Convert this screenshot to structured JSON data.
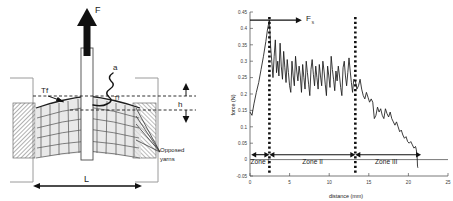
{
  "figure": {
    "panels": [
      "tear-test-schematic",
      "force-distance-plot"
    ]
  },
  "left_diagram": {
    "title_none": "",
    "labels": {
      "force_arrow": "F",
      "yarn_tension_left": "Tf",
      "yarn_tension_right": "Tf",
      "crack_label": "a",
      "height_label": "h",
      "length_label": "L",
      "opposed_yarns_line1": "Opposed",
      "opposed_yarns_line2": "yarns"
    },
    "colors": {
      "ink": "#1a1a1a",
      "grid_fabric": "#555555",
      "clamp_hatch": "#888888",
      "shade_fill": "#d8d8d8",
      "frame": "#9a9a9a"
    }
  },
  "chart_data": {
    "type": "line",
    "title": "",
    "xlabel": "distance (mm)",
    "ylabel": "force (N)",
    "xlim": [
      0,
      25
    ],
    "ylim": [
      -0.05,
      0.45
    ],
    "xticks": [
      0,
      5,
      10,
      15,
      20,
      25
    ],
    "xticklabels": [
      "0",
      "5",
      "10",
      "15",
      "20",
      "25"
    ],
    "yticks": [
      -0.05,
      0,
      0.05,
      0.1,
      0.15,
      0.2,
      0.25,
      0.3,
      0.35,
      0.4,
      0.45
    ],
    "yticklabels": [
      "-0.05",
      "0",
      "0.05",
      "0.1",
      "0.15",
      "0.2",
      "0.25",
      "0.3",
      "0.35",
      "0.4",
      "0.45"
    ],
    "grid": false,
    "legend": null,
    "annotations": [
      {
        "name": "peak-force-arrow",
        "label": "Fs",
        "y": 0.425,
        "x_from": 0.0,
        "x_to": 6.3
      },
      {
        "name": "zone-1-label",
        "label": "Zone I",
        "x_center": 1.25,
        "y": 0.0
      },
      {
        "name": "zone-2-label",
        "label": "Zone II",
        "x_center": 7.9,
        "y": 0.0
      },
      {
        "name": "zone-3-label",
        "label": "Zone III",
        "x_center": 17.2,
        "y": 0.0
      },
      {
        "name": "zone-divider-1",
        "x": 2.45
      },
      {
        "name": "zone-divider-2",
        "x": 13.3
      }
    ],
    "series": [
      {
        "name": "tear force",
        "x": [
          0.0,
          0.25,
          0.5,
          0.8,
          1.1,
          1.4,
          1.7,
          2.0,
          2.2,
          2.4,
          2.45,
          2.6,
          2.75,
          2.9,
          3.05,
          3.2,
          3.35,
          3.5,
          3.65,
          3.8,
          3.95,
          4.1,
          4.25,
          4.4,
          4.55,
          4.7,
          4.85,
          5.0,
          5.15,
          5.3,
          5.45,
          5.6,
          5.75,
          5.9,
          6.05,
          6.2,
          6.35,
          6.5,
          6.65,
          6.8,
          6.95,
          7.1,
          7.25,
          7.4,
          7.55,
          7.7,
          7.85,
          8.0,
          8.15,
          8.3,
          8.45,
          8.6,
          8.75,
          8.9,
          9.05,
          9.2,
          9.35,
          9.5,
          9.65,
          9.8,
          9.95,
          10.1,
          10.25,
          10.4,
          10.55,
          10.7,
          10.85,
          11.0,
          11.15,
          11.3,
          11.45,
          11.6,
          11.75,
          11.9,
          12.05,
          12.2,
          12.35,
          12.5,
          12.65,
          12.8,
          12.95,
          13.1,
          13.3,
          13.5,
          13.7,
          13.9,
          14.1,
          14.3,
          14.5,
          14.7,
          14.9,
          15.1,
          15.3,
          15.5,
          15.7,
          15.9,
          16.1,
          16.3,
          16.5,
          16.7,
          16.9,
          17.1,
          17.3,
          17.5,
          17.7,
          17.9,
          18.1,
          18.3,
          18.5,
          18.7,
          18.9,
          19.1,
          19.3,
          19.5,
          19.7,
          19.9,
          20.1,
          20.3,
          20.5,
          20.7,
          20.9,
          21.0,
          21.1,
          21.15,
          21.2
        ],
        "y": [
          0.145,
          0.135,
          0.17,
          0.205,
          0.235,
          0.275,
          0.315,
          0.36,
          0.395,
          0.42,
          0.425,
          0.345,
          0.3,
          0.25,
          0.315,
          0.365,
          0.265,
          0.3,
          0.255,
          0.355,
          0.285,
          0.245,
          0.33,
          0.28,
          0.235,
          0.305,
          0.265,
          0.225,
          0.205,
          0.3,
          0.255,
          0.225,
          0.315,
          0.27,
          0.24,
          0.285,
          0.255,
          0.205,
          0.29,
          0.25,
          0.215,
          0.3,
          0.265,
          0.23,
          0.195,
          0.275,
          0.305,
          0.26,
          0.225,
          0.285,
          0.25,
          0.215,
          0.29,
          0.255,
          0.225,
          0.3,
          0.27,
          0.23,
          0.195,
          0.285,
          0.255,
          0.22,
          0.315,
          0.275,
          0.245,
          0.21,
          0.27,
          0.24,
          0.285,
          0.255,
          0.22,
          0.195,
          0.28,
          0.3,
          0.255,
          0.225,
          0.265,
          0.31,
          0.27,
          0.235,
          0.205,
          0.245,
          0.24,
          0.215,
          0.225,
          0.245,
          0.215,
          0.195,
          0.185,
          0.205,
          0.19,
          0.175,
          0.185,
          0.175,
          0.125,
          0.135,
          0.16,
          0.145,
          0.155,
          0.135,
          0.125,
          0.155,
          0.14,
          0.13,
          0.145,
          0.125,
          0.115,
          0.105,
          0.115,
          0.1,
          0.085,
          0.09,
          0.075,
          0.065,
          0.07,
          0.055,
          0.05,
          0.055,
          0.045,
          0.035,
          0.04,
          0.03,
          0.01,
          -0.02,
          -0.025
        ]
      }
    ]
  }
}
